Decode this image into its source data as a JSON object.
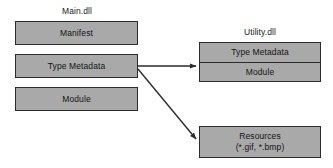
{
  "diagram": {
    "background_color": "#ffffff",
    "box_fill_color": "#a9a9a9",
    "box_border_color": "#2b2b2b",
    "text_color": "#141414",
    "arrow_color": "#2b2b2b"
  },
  "groups": {
    "main": {
      "label": "Main.dll",
      "boxes": [
        {
          "label": "Manifest"
        },
        {
          "label": "Type Metadata"
        },
        {
          "label": "Module"
        }
      ]
    },
    "utility": {
      "label": "Utility.dll",
      "boxes": [
        {
          "label": "Type Metadata"
        },
        {
          "label": "Module"
        }
      ]
    },
    "resources": {
      "label_line1": "Resources",
      "label_line2": "(*.gif, *.bmp)"
    }
  },
  "arrows": [
    {
      "name": "type-metadata-to-utility",
      "from": "Main.dll Type Metadata",
      "to": "Utility.dll Type Metadata",
      "style": "straight-horizontal"
    },
    {
      "name": "type-metadata-to-resources",
      "from": "Main.dll Type Metadata",
      "to": "Resources (*.gif, *.bmp)",
      "style": "diagonal"
    }
  ]
}
